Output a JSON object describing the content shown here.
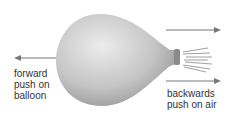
{
  "diagram": {
    "labels": {
      "forward": [
        "forward",
        "push on",
        "balloon"
      ],
      "backward": [
        "backwards",
        "push on air"
      ]
    },
    "colors": {
      "balloon_light": "#e6e6e6",
      "balloon_dark": "#9a9a9a",
      "arrow": "#777777",
      "text": "#333333"
    }
  }
}
